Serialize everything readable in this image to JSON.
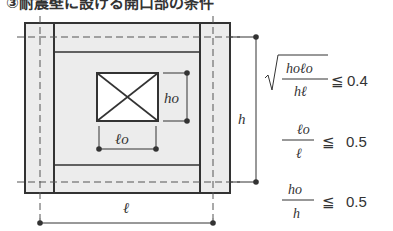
{
  "title": "③耐震壁に設ける開口部の条件",
  "labels": {
    "opening_height": "ho",
    "opening_width": "ℓo",
    "wall_height": "h",
    "wall_length": "ℓ"
  },
  "conditions": [
    {
      "type": "sqrt",
      "numerator": "hoℓo",
      "denominator": "hℓ",
      "operator": "≦",
      "value": "0.4"
    },
    {
      "type": "fraction",
      "numerator": "ℓo",
      "denominator": "ℓ",
      "operator": "≦",
      "value": "0.5"
    },
    {
      "type": "fraction",
      "numerator": "ho",
      "denominator": "h",
      "operator": "≦",
      "value": "0.5"
    }
  ],
  "colors": {
    "wall_fill": "#ececec",
    "line": "#333333",
    "opening_fill": "#ffffff"
  }
}
